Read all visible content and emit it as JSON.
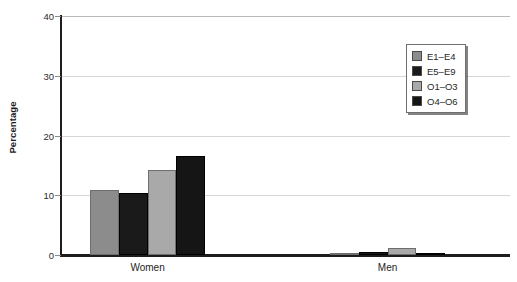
{
  "chart_data": {
    "type": "bar",
    "title": "",
    "xlabel": "",
    "ylabel": "Percentage",
    "ylim": [
      0,
      40
    ],
    "yticks": [
      0,
      10,
      20,
      30,
      40
    ],
    "ytick_labels": [
      "0",
      "10",
      "20",
      "30",
      "40"
    ],
    "grid": true,
    "legend_position": "upper right",
    "categories": [
      "Women",
      "Men"
    ],
    "series": [
      {
        "name": "E1–E4",
        "color": "#8c8c8c",
        "values": [
          10.8,
          0.4
        ]
      },
      {
        "name": "E5–E9",
        "color": "#1a1a1a",
        "values": [
          10.3,
          0.5
        ]
      },
      {
        "name": "O1–O3",
        "color": "#a9a9a9",
        "values": [
          14.2,
          1.2
        ]
      },
      {
        "name": "O4–O6",
        "color": "#151515",
        "values": [
          16.6,
          0.1
        ]
      }
    ]
  },
  "axes": {
    "y_title": "Percentage"
  },
  "colors": {
    "axis": "#1d1d1d",
    "gridline": "#d7d7d7",
    "plot_border": "#b9b9b9",
    "text": "#252525",
    "legend_border": "#6f6f6f",
    "background": "#ffffff"
  }
}
